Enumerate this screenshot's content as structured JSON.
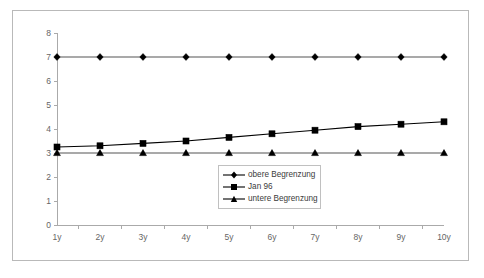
{
  "chart_data": {
    "type": "line",
    "title": "",
    "subtitle": "",
    "xlabel": "",
    "ylabel": "",
    "categories": [
      "1y",
      "2y",
      "3y",
      "4y",
      "5y",
      "6y",
      "7y",
      "8y",
      "9y",
      "10y"
    ],
    "ylim": [
      0,
      8
    ],
    "ytick_labels": [
      "0",
      "1",
      "2",
      "3",
      "4",
      "5",
      "6",
      "7",
      "8"
    ],
    "ytick_values": [
      0,
      1,
      2,
      3,
      4,
      5,
      6,
      7,
      8
    ],
    "grid": false,
    "legend_position": "inside-bottom-center",
    "series": [
      {
        "name": "obere Begrenzung",
        "marker": "diamond",
        "color": "#000000",
        "values": [
          7.0,
          7.0,
          7.0,
          7.0,
          7.0,
          7.0,
          7.0,
          7.0,
          7.0,
          7.0
        ]
      },
      {
        "name": "Jan 96",
        "marker": "square",
        "color": "#000000",
        "values": [
          3.25,
          3.3,
          3.4,
          3.5,
          3.65,
          3.8,
          3.95,
          4.1,
          4.2,
          4.3
        ]
      },
      {
        "name": "untere Begrenzung",
        "marker": "triangle",
        "color": "#000000",
        "values": [
          3.0,
          3.0,
          3.0,
          3.0,
          3.0,
          3.0,
          3.0,
          3.0,
          3.0,
          3.0
        ]
      }
    ]
  },
  "legend": {
    "items": [
      {
        "label": "obere Begrenzung",
        "marker": "diamond"
      },
      {
        "label": "Jan 96",
        "marker": "square"
      },
      {
        "label": "untere Begrenzung",
        "marker": "triangle"
      }
    ]
  },
  "colors": {
    "plot_background": "#ffffff",
    "frame_border": "#b9b9b9",
    "axis": "#aaaaaa",
    "tick_text": "#666666",
    "series_stroke": "#000000",
    "flat_series_stroke": "#555555",
    "legend_border": "#c0c0c0"
  },
  "geometry": {
    "plot_left": 57,
    "plot_right": 444,
    "plot_top": 33,
    "plot_bottom": 225
  }
}
